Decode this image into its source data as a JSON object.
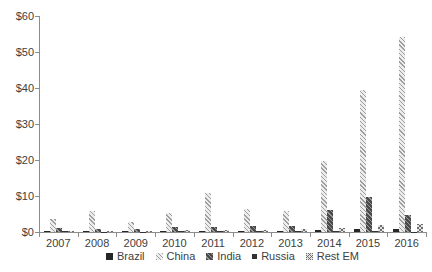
{
  "chart_data": {
    "type": "bar",
    "title": "",
    "xlabel": "",
    "ylabel": "",
    "ylim": [
      0,
      60
    ],
    "grid": false,
    "legend_position": "bottom",
    "y_ticks": [
      "$0",
      "$10",
      "$20",
      "$30",
      "$40",
      "$50",
      "$60"
    ],
    "categories": [
      "2007",
      "2008",
      "2009",
      "2010",
      "2011",
      "2012",
      "2013",
      "2014",
      "2015",
      "2016"
    ],
    "series": [
      {
        "name": "Brazil",
        "pattern": "solid",
        "color": "#262626",
        "values": [
          0.3,
          0.3,
          0.2,
          0.3,
          0.3,
          0.3,
          0.4,
          0.6,
          0.7,
          0.9
        ]
      },
      {
        "name": "China",
        "pattern": "diag-light",
        "color": "#9e9e9e",
        "values": [
          3.6,
          5.7,
          2.8,
          5.2,
          10.8,
          6.4,
          5.8,
          19.7,
          39.5,
          54.2
        ]
      },
      {
        "name": "India",
        "pattern": "diag-dark",
        "color": "#4a4a4a",
        "values": [
          1.1,
          0.9,
          0.7,
          1.4,
          1.5,
          1.7,
          1.7,
          6.0,
          9.8,
          4.7
        ]
      },
      {
        "name": "Russia",
        "pattern": "solid",
        "color": "#333333",
        "values": [
          0.15,
          0.1,
          0.1,
          0.2,
          0.2,
          0.3,
          0.2,
          0.2,
          0.2,
          0.1
        ]
      },
      {
        "name": "Rest EM",
        "pattern": "checker",
        "color": "#6e6e6e",
        "values": [
          0.3,
          0.4,
          0.3,
          0.6,
          0.5,
          0.5,
          0.7,
          1.0,
          2.0,
          2.2
        ]
      }
    ],
    "axis_color": "#8c8c8c",
    "text_color": "#404040"
  }
}
